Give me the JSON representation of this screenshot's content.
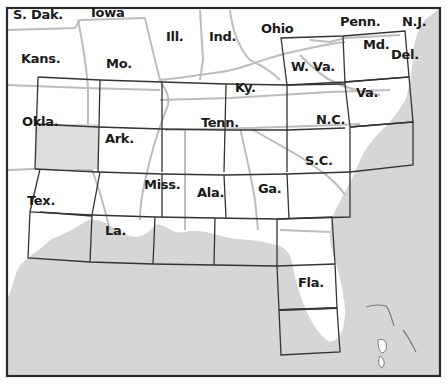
{
  "map": {
    "type": "index-grid-map",
    "region": "Southeastern United States",
    "colors": {
      "land": "#ffffff",
      "water": "#d6d6d6",
      "border": "#2a2a2a",
      "state_lines": "#bdbdbd",
      "grid_lines": "#333333",
      "highlight_cell": "#dcdcdc"
    },
    "labels": [
      {
        "id": "s-dak",
        "text": "S. Dak.",
        "x": 13,
        "y": 8
      },
      {
        "id": "iowa",
        "text": "Iowa",
        "x": 91,
        "y": 6
      },
      {
        "id": "ill",
        "text": "Ill.",
        "x": 166,
        "y": 30
      },
      {
        "id": "ind",
        "text": "Ind.",
        "x": 209,
        "y": 30
      },
      {
        "id": "ohio",
        "text": "Ohio",
        "x": 261,
        "y": 22
      },
      {
        "id": "penn",
        "text": "Penn.",
        "x": 340,
        "y": 15
      },
      {
        "id": "nj",
        "text": "N.J.",
        "x": 402,
        "y": 15
      },
      {
        "id": "kans",
        "text": "Kans.",
        "x": 21,
        "y": 52
      },
      {
        "id": "mo",
        "text": "Mo.",
        "x": 106,
        "y": 57
      },
      {
        "id": "md",
        "text": "Md.",
        "x": 363,
        "y": 38
      },
      {
        "id": "del",
        "text": "Del.",
        "x": 391,
        "y": 48
      },
      {
        "id": "wva",
        "text": "W. Va.",
        "x": 291,
        "y": 60
      },
      {
        "id": "ky",
        "text": "Ky.",
        "x": 235,
        "y": 81
      },
      {
        "id": "va",
        "text": "Va.",
        "x": 356,
        "y": 86
      },
      {
        "id": "okla",
        "text": "Okla.",
        "x": 22,
        "y": 115
      },
      {
        "id": "tenn",
        "text": "Tenn.",
        "x": 201,
        "y": 116
      },
      {
        "id": "nc",
        "text": "N.C.",
        "x": 316,
        "y": 113
      },
      {
        "id": "ark",
        "text": "Ark.",
        "x": 105,
        "y": 132
      },
      {
        "id": "sc",
        "text": "S.C.",
        "x": 305,
        "y": 154
      },
      {
        "id": "miss",
        "text": "Miss.",
        "x": 144,
        "y": 178
      },
      {
        "id": "ala",
        "text": "Ala.",
        "x": 197,
        "y": 186
      },
      {
        "id": "ga",
        "text": "Ga.",
        "x": 258,
        "y": 182
      },
      {
        "id": "tex",
        "text": "Tex.",
        "x": 27,
        "y": 194
      },
      {
        "id": "la",
        "text": "La.",
        "x": 105,
        "y": 224
      },
      {
        "id": "fla",
        "text": "Fla.",
        "x": 298,
        "y": 276
      }
    ]
  }
}
